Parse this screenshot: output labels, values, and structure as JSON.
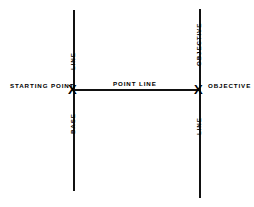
{
  "diagram": {
    "background_color": "#ffffff",
    "ink_color": "#111111",
    "markers": {
      "starting_point_glyph": "X",
      "objective_glyph": "X"
    },
    "labels": {
      "starting_point": "STARTING POINT",
      "point_line": "POINT LINE",
      "objective": "OBJECTIVE",
      "base_line_word_1": "LINE",
      "base_line_word_2": "BASE",
      "objective_line_word_1": "OBJECTIVE",
      "objective_line_word_2": "LINE"
    }
  }
}
